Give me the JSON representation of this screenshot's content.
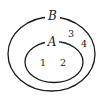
{
  "diagram": {
    "type": "venn",
    "sets": [
      {
        "id": "B",
        "label": "B",
        "contains": [
          "A"
        ],
        "elements_only_in_set": [
          "3",
          "4"
        ]
      },
      {
        "id": "A",
        "label": "A",
        "subset_of": "B",
        "elements": [
          "1",
          "2"
        ]
      }
    ],
    "labels": {
      "outer": "B",
      "inner": "A"
    },
    "elements": {
      "e1": "1",
      "e2": "2",
      "e3": "3",
      "e4": "4"
    },
    "colors": {
      "stroke": "#1a1a1a",
      "background": "#ffffff"
    }
  }
}
